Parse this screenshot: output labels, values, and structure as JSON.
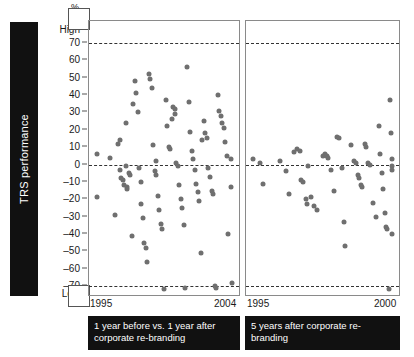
{
  "axis_title": "TRS performance",
  "unit_label": "%",
  "high_label": "High",
  "low_label": "Low",
  "y_ticks": [
    70,
    60,
    50,
    40,
    30,
    20,
    10,
    0,
    -10,
    -20,
    -30,
    -40,
    -50,
    -60,
    -70
  ],
  "panels": [
    {
      "id": "panel-1",
      "x_start_label": "1995",
      "x_end_label": "2004",
      "caption": "1 year before vs. 1 year after corporate re-branding"
    },
    {
      "id": "panel-2",
      "x_start_label": "1995",
      "x_end_label": "2000",
      "caption": "5 years after corporate re-branding"
    }
  ],
  "chart_data": {
    "type": "scatter",
    "title": "",
    "ylabel": "TRS performance",
    "ylabel_unit": "%",
    "ylim": [
      -78,
      78
    ],
    "y_axis_high_marker": "High",
    "y_axis_low_marker": "Low",
    "y_ticks": [
      70,
      60,
      50,
      40,
      30,
      20,
      10,
      0,
      -10,
      -20,
      -30,
      -40,
      -50,
      -60,
      -70
    ],
    "grid": false,
    "legend": "none",
    "reference_lines": [
      {
        "y": 70,
        "style": "dashed"
      },
      {
        "y": 0,
        "style": "dashed"
      },
      {
        "y": -70,
        "style": "dashed"
      }
    ],
    "marker_color": "#6f6f6f",
    "panels": [
      {
        "name": "1 year before vs. 1 year after corporate re-branding",
        "xlim": [
          1995,
          2004
        ],
        "x_ticks": [
          1995,
          2004
        ],
        "points": [
          {
            "x": 1995.1,
            "y": 6
          },
          {
            "x": 1995.1,
            "y": -19
          },
          {
            "x": 1996.0,
            "y": 4
          },
          {
            "x": 1996.3,
            "y": -29
          },
          {
            "x": 1996.5,
            "y": 12
          },
          {
            "x": 1996.6,
            "y": 14
          },
          {
            "x": 1996.6,
            "y": -3
          },
          {
            "x": 1996.7,
            "y": -8
          },
          {
            "x": 1996.8,
            "y": -9
          },
          {
            "x": 1996.9,
            "y": -12
          },
          {
            "x": 1997.0,
            "y": 24
          },
          {
            "x": 1997.0,
            "y": -1
          },
          {
            "x": 1997.1,
            "y": -13
          },
          {
            "x": 1997.1,
            "y": -14
          },
          {
            "x": 1997.2,
            "y": -5
          },
          {
            "x": 1997.3,
            "y": -6
          },
          {
            "x": 1997.4,
            "y": -41
          },
          {
            "x": 1997.5,
            "y": 35
          },
          {
            "x": 1997.6,
            "y": 48
          },
          {
            "x": 1997.7,
            "y": 41
          },
          {
            "x": 1997.8,
            "y": 30
          },
          {
            "x": 1997.9,
            "y": -2
          },
          {
            "x": 1998.0,
            "y": -10
          },
          {
            "x": 1998.0,
            "y": -23
          },
          {
            "x": 1998.1,
            "y": -31
          },
          {
            "x": 1998.2,
            "y": -45
          },
          {
            "x": 1998.3,
            "y": -48
          },
          {
            "x": 1998.4,
            "y": -56
          },
          {
            "x": 1998.5,
            "y": 52
          },
          {
            "x": 1998.6,
            "y": 49
          },
          {
            "x": 1998.7,
            "y": 44
          },
          {
            "x": 1998.8,
            "y": 11
          },
          {
            "x": 1998.9,
            "y": -4
          },
          {
            "x": 1999.0,
            "y": 2
          },
          {
            "x": 1999.0,
            "y": -6
          },
          {
            "x": 1999.1,
            "y": -18
          },
          {
            "x": 1999.2,
            "y": -26
          },
          {
            "x": 1999.3,
            "y": -34
          },
          {
            "x": 1999.4,
            "y": -37
          },
          {
            "x": 1999.5,
            "y": -72
          },
          {
            "x": 1999.6,
            "y": 37
          },
          {
            "x": 1999.7,
            "y": 22
          },
          {
            "x": 1999.8,
            "y": 10
          },
          {
            "x": 1999.9,
            "y": 9
          },
          {
            "x": 2000.0,
            "y": 26
          },
          {
            "x": 2000.1,
            "y": 33
          },
          {
            "x": 2000.2,
            "y": 32
          },
          {
            "x": 2000.2,
            "y": 29
          },
          {
            "x": 2000.3,
            "y": 1
          },
          {
            "x": 2000.4,
            "y": -1
          },
          {
            "x": 2000.5,
            "y": -12
          },
          {
            "x": 2000.6,
            "y": -20
          },
          {
            "x": 2000.7,
            "y": -25
          },
          {
            "x": 2000.8,
            "y": -35
          },
          {
            "x": 2000.9,
            "y": -71
          },
          {
            "x": 2001.0,
            "y": 56
          },
          {
            "x": 2001.1,
            "y": 36
          },
          {
            "x": 2001.2,
            "y": 19
          },
          {
            "x": 2001.3,
            "y": 8
          },
          {
            "x": 2001.4,
            "y": 3
          },
          {
            "x": 2001.5,
            "y": -3
          },
          {
            "x": 2001.6,
            "y": -11
          },
          {
            "x": 2001.7,
            "y": -16
          },
          {
            "x": 2001.8,
            "y": -21
          },
          {
            "x": 2001.9,
            "y": -51
          },
          {
            "x": 2002.0,
            "y": 14
          },
          {
            "x": 2002.1,
            "y": 25
          },
          {
            "x": 2002.2,
            "y": 18
          },
          {
            "x": 2002.3,
            "y": 15
          },
          {
            "x": 2002.4,
            "y": -2
          },
          {
            "x": 2002.5,
            "y": -7
          },
          {
            "x": 2002.6,
            "y": -15
          },
          {
            "x": 2002.7,
            "y": -17
          },
          {
            "x": 2002.8,
            "y": -70
          },
          {
            "x": 2002.9,
            "y": -71
          },
          {
            "x": 2003.0,
            "y": 40
          },
          {
            "x": 2003.1,
            "y": 31
          },
          {
            "x": 2003.2,
            "y": 28
          },
          {
            "x": 2003.3,
            "y": 24
          },
          {
            "x": 2003.4,
            "y": 21
          },
          {
            "x": 2003.5,
            "y": 13
          },
          {
            "x": 2003.6,
            "y": 5
          },
          {
            "x": 2003.7,
            "y": -40
          },
          {
            "x": 2003.9,
            "y": 3
          },
          {
            "x": 2003.9,
            "y": -13
          },
          {
            "x": 2003.95,
            "y": -68
          }
        ]
      },
      {
        "name": "5 years after corporate re-branding",
        "xlim": [
          1995,
          2000
        ],
        "x_ticks": [
          1995,
          2000
        ],
        "points": [
          {
            "x": 1995.05,
            "y": 3
          },
          {
            "x": 1995.3,
            "y": 1
          },
          {
            "x": 1995.4,
            "y": -11
          },
          {
            "x": 1996.0,
            "y": 2
          },
          {
            "x": 1996.2,
            "y": -4
          },
          {
            "x": 1996.3,
            "y": -17
          },
          {
            "x": 1996.5,
            "y": 7
          },
          {
            "x": 1996.6,
            "y": 9
          },
          {
            "x": 1996.7,
            "y": 8
          },
          {
            "x": 1996.75,
            "y": -9
          },
          {
            "x": 1996.8,
            "y": -10
          },
          {
            "x": 1996.9,
            "y": -20
          },
          {
            "x": 1996.95,
            "y": -23
          },
          {
            "x": 1997.0,
            "y": -1
          },
          {
            "x": 1997.1,
            "y": -19
          },
          {
            "x": 1997.2,
            "y": -24
          },
          {
            "x": 1997.3,
            "y": -26
          },
          {
            "x": 1997.5,
            "y": 5
          },
          {
            "x": 1997.6,
            "y": 6
          },
          {
            "x": 1997.65,
            "y": 5
          },
          {
            "x": 1997.7,
            "y": 4
          },
          {
            "x": 1997.8,
            "y": -3
          },
          {
            "x": 1997.9,
            "y": -15
          },
          {
            "x": 1998.0,
            "y": 16
          },
          {
            "x": 1998.1,
            "y": 15
          },
          {
            "x": 1998.2,
            "y": -2
          },
          {
            "x": 1998.25,
            "y": -33
          },
          {
            "x": 1998.3,
            "y": -47
          },
          {
            "x": 1998.5,
            "y": 11
          },
          {
            "x": 1998.6,
            "y": 2
          },
          {
            "x": 1998.7,
            "y": 1
          },
          {
            "x": 1998.75,
            "y": -6
          },
          {
            "x": 1998.8,
            "y": -8
          },
          {
            "x": 1998.85,
            "y": -12
          },
          {
            "x": 1998.9,
            "y": -13
          },
          {
            "x": 1999.0,
            "y": 12
          },
          {
            "x": 1999.05,
            "y": 10
          },
          {
            "x": 1999.1,
            "y": 1
          },
          {
            "x": 1999.2,
            "y": 0
          },
          {
            "x": 1999.3,
            "y": -22
          },
          {
            "x": 1999.4,
            "y": -30
          },
          {
            "x": 1999.5,
            "y": 22
          },
          {
            "x": 1999.55,
            "y": 6
          },
          {
            "x": 1999.6,
            "y": -5
          },
          {
            "x": 1999.65,
            "y": -14
          },
          {
            "x": 1999.7,
            "y": -28
          },
          {
            "x": 1999.75,
            "y": -36
          },
          {
            "x": 1999.8,
            "y": -37
          },
          {
            "x": 1999.85,
            "y": -72
          },
          {
            "x": 1999.9,
            "y": 37
          },
          {
            "x": 1999.92,
            "y": 18
          },
          {
            "x": 1999.95,
            "y": 3
          },
          {
            "x": 1999.96,
            "y": -1
          },
          {
            "x": 1999.97,
            "y": -3
          },
          {
            "x": 1999.98,
            "y": -40
          }
        ]
      }
    ]
  }
}
